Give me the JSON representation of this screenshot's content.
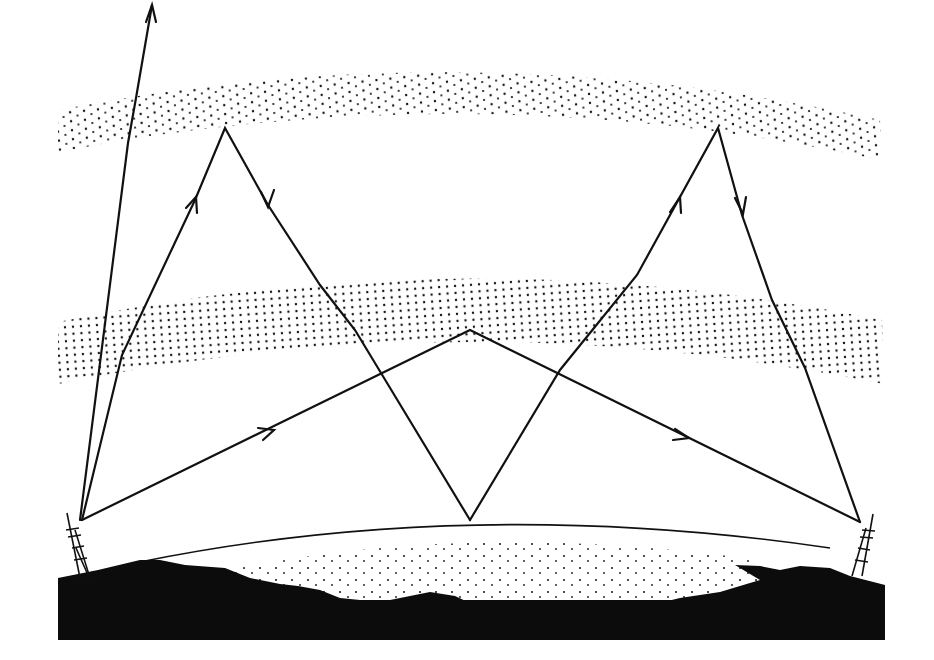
{
  "diagram": {
    "type": "ionospheric radio wave propagation",
    "labels": [],
    "colors": {
      "ink": "#111111",
      "background": "#ffffff"
    },
    "layers": [
      {
        "name": "upper-ionosphere-layer",
        "density": "sparse",
        "path_top": "M58,110 Q470,30 880,120",
        "path_bottom": "M58,150 Q470,70 880,160"
      },
      {
        "name": "lower-ionosphere-layer",
        "density": "dense-rows",
        "path_top": "M58,322 Q470,235 882,320",
        "path_bottom": "M58,382 Q470,300 882,383"
      }
    ],
    "rays": [
      {
        "name": "escaping-ray",
        "points": [
          [
            80,
            520
          ],
          [
            128,
            143
          ],
          [
            136,
            98
          ],
          [
            152,
            5
          ]
        ],
        "arrow_at": [
          152,
          5
        ]
      },
      {
        "name": "left-high-skywave-ray",
        "points": [
          [
            82,
            520
          ],
          [
            122,
            355
          ],
          [
            195,
            200
          ],
          [
            225,
            128
          ],
          [
            268,
            205
          ],
          [
            320,
            285
          ],
          [
            355,
            330
          ],
          [
            470,
            520
          ]
        ],
        "arrows": [
          [
            195,
            200
          ],
          [
            268,
            205
          ]
        ]
      },
      {
        "name": "low-skywave-ray",
        "points": [
          [
            82,
            520
          ],
          [
            470,
            330
          ],
          [
            860,
            522
          ]
        ],
        "arrows": [
          [
            272,
            430
          ],
          [
            688,
            438
          ]
        ]
      },
      {
        "name": "right-high-skywave-ray",
        "points": [
          [
            470,
            520
          ],
          [
            560,
            370
          ],
          [
            637,
            275
          ],
          [
            718,
            128
          ],
          [
            742,
            215
          ],
          [
            772,
            300
          ],
          [
            805,
            368
          ],
          [
            860,
            522
          ]
        ],
        "arrows": [
          [
            679,
            198
          ],
          [
            742,
            215
          ]
        ]
      }
    ],
    "earth_curve": "M140,562 Q470,495 830,548",
    "towers": [
      {
        "name": "left-transmitter-tower",
        "x": 80,
        "base_y": 578
      },
      {
        "name": "right-receiver-tower",
        "x": 862,
        "base_y": 576
      }
    ]
  }
}
